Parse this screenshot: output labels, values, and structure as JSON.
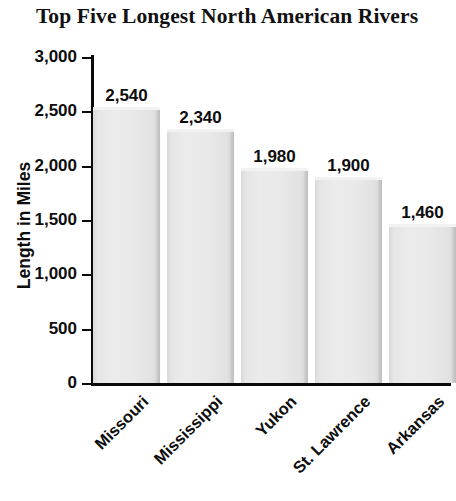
{
  "chart_data": {
    "type": "bar",
    "title": "Top Five Longest North American Rivers",
    "xlabel": "",
    "ylabel": "Length in Miles",
    "categories": [
      "Missouri",
      "Mississippi",
      "Yukon",
      "St. Lawrence",
      "Arkansas"
    ],
    "values": [
      2540,
      2340,
      1980,
      1900,
      1460
    ],
    "value_labels": [
      "2,540",
      "2,340",
      "1,980",
      "1,900",
      "1,460"
    ],
    "ylim": [
      0,
      3000
    ],
    "y_ticks": [
      0,
      500,
      1000,
      1500,
      2000,
      2500,
      3000
    ],
    "y_tick_labels": [
      "0",
      "500",
      "1,000",
      "1,500",
      "2,000",
      "2,500",
      "3,000"
    ],
    "grid": false,
    "legend": false,
    "legend_position": "none",
    "bar_color": "#e8e8e8",
    "axis_color": "#0a0a0a",
    "text_color": "#0d0d0d",
    "background_color": "#ffffff"
  }
}
